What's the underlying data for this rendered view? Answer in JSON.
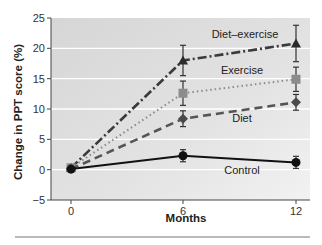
{
  "chart_data": {
    "type": "line",
    "title": "",
    "xlabel": "Months",
    "ylabel": "Change in PPT score (%)",
    "x": [
      0,
      6,
      12
    ],
    "x_ticks": [
      "0",
      "6",
      "12"
    ],
    "y_ticks": [
      "25",
      "20",
      "15",
      "10",
      "5",
      "0",
      "−5"
    ],
    "ylim": [
      -5,
      25
    ],
    "grid": "horizontal",
    "legend": "inline labels",
    "series": [
      {
        "name": "Diet–exercise",
        "marker": "triangle",
        "line": "dash-dot",
        "color": "#3a3a3a",
        "values": [
          0.3,
          18.0,
          20.8
        ],
        "errors": [
          0.5,
          2.5,
          3.0
        ]
      },
      {
        "name": "Exercise",
        "marker": "square",
        "line": "dotted",
        "color": "#8a8a8a",
        "values": [
          0.3,
          12.6,
          14.9
        ],
        "errors": [
          0.5,
          2.0,
          2.0
        ]
      },
      {
        "name": "Diet",
        "marker": "diamond",
        "line": "dashed",
        "color": "#555555",
        "values": [
          0.1,
          8.4,
          11.1
        ],
        "errors": [
          0.5,
          1.3,
          1.3
        ]
      },
      {
        "name": "Control",
        "marker": "circle",
        "line": "solid",
        "color": "#111111",
        "values": [
          0.1,
          2.3,
          1.2
        ],
        "errors": [
          0.5,
          1.0,
          1.0
        ]
      }
    ]
  }
}
